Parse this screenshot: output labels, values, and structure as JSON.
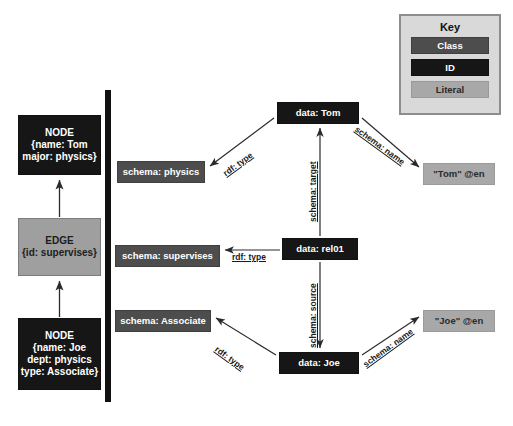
{
  "diagram": {
    "colors": {
      "id": "#161616",
      "class": "#4d4d4d",
      "literal": "#a8a8a8",
      "edge": "#9f9f9f",
      "key_panel": "#d9d9d9",
      "divider": "#111111"
    }
  },
  "key": {
    "title": "Key",
    "items": [
      {
        "label": "Class",
        "role": "class"
      },
      {
        "label": "ID",
        "role": "id"
      },
      {
        "label": "Literal",
        "role": "literal"
      }
    ]
  },
  "property_graph": {
    "node_tom": {
      "line1": "NODE",
      "line2": "{name: Tom",
      "line3": "major: physics}"
    },
    "edge_supervises": {
      "line1": "EDGE",
      "line2": "{id: supervises}"
    },
    "node_joe": {
      "line1": "NODE",
      "line2": "{name: Joe",
      "line3": "dept: physics",
      "line4": "type: Associate}"
    }
  },
  "rdf_graph": {
    "classes": {
      "physics": "schema: physics",
      "supervises": "schema: supervises",
      "associate": "schema: Associate"
    },
    "ids": {
      "tom": "data: Tom",
      "rel01": "data: rel01",
      "joe": "data: Joe"
    },
    "literals": {
      "tom": "\"Tom\" @en",
      "joe": "\"Joe\" @en"
    }
  },
  "edge_labels": {
    "rdf_type_tom": "rdf: type",
    "rdf_type_rel": "rdf: type",
    "rdf_type_joe": "rdf: type",
    "schema_name_tom": "schema: name",
    "schema_name_joe": "schema: name",
    "schema_target": "schema: target",
    "schema_source": "schema: source"
  }
}
